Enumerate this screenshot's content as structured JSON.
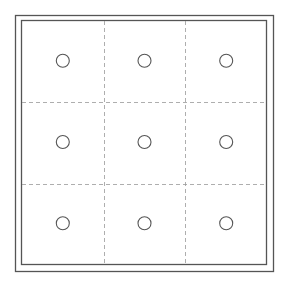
{
  "diagram": {
    "rows": 3,
    "columns": 3,
    "cells": [
      {
        "row": 0,
        "col": 0,
        "shape": "circle"
      },
      {
        "row": 0,
        "col": 1,
        "shape": "circle"
      },
      {
        "row": 0,
        "col": 2,
        "shape": "circle"
      },
      {
        "row": 1,
        "col": 0,
        "shape": "circle"
      },
      {
        "row": 1,
        "col": 1,
        "shape": "circle"
      },
      {
        "row": 1,
        "col": 2,
        "shape": "circle"
      },
      {
        "row": 2,
        "col": 0,
        "shape": "circle"
      },
      {
        "row": 2,
        "col": 1,
        "shape": "circle"
      },
      {
        "row": 2,
        "col": 2,
        "shape": "circle"
      }
    ],
    "colors": {
      "frame": "#555555",
      "grid": "#999999",
      "circle": "#555555"
    }
  }
}
